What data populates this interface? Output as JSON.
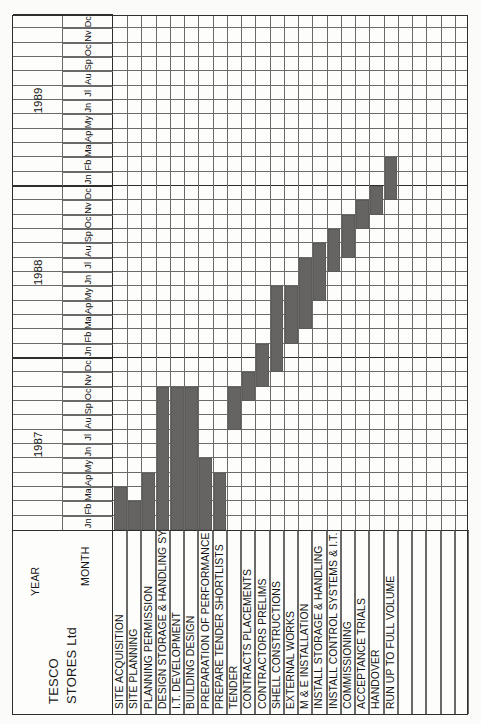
{
  "document": {
    "title_line1": "TESCO",
    "title_line2": "STORES Ltd",
    "year_caption": "YEAR",
    "month_caption": "MONTH"
  },
  "chart_data": {
    "type": "bar",
    "title": "TESCO STORES Ltd",
    "xlabel": "MONTH",
    "ylabel": "",
    "grid": true,
    "orientation": "gantt-vertical-scan",
    "years": [
      "1987",
      "1988",
      "1989"
    ],
    "months": [
      "Jn",
      "Fb",
      "Ma",
      "Ap",
      "My",
      "Jn",
      "Jl",
      "Au",
      "Sp",
      "Oc",
      "Nv",
      "Dc"
    ],
    "month_count_total": 36,
    "categories": [
      "SITE ACQUISITION",
      "SITE PLANNING",
      "PLANNING PERMISSION",
      "DESIGN STORAGE & HANDLING SYSTEMS",
      "I.T. DEVELOPMENT",
      "BUILDING DESIGN",
      "PREPARATION OF PERFORMANCE SPECS",
      "PREPARE TENDER SHORTLISTS",
      "TENDER",
      "CONTRACTS PLACEMENTS",
      "CONTRACTORS PRELIMS",
      "SHELL CONSTRUCTIONS",
      "EXTERNAL WORKS",
      "M & E INSTALLATION",
      "INSTALL STORAGE & HANDLING",
      "INSTALL CONTROL SYSTEMS & I.T.",
      "COMMISSIONING",
      "ACCEPTANCE TRIALS",
      "HANDOVER",
      "RUN UP TO FULL VOLUME",
      "",
      "",
      "",
      "",
      ""
    ],
    "tasks": [
      {
        "name": "SITE ACQUISITION",
        "start_month": 1,
        "end_month": 3,
        "start_label": "Jn 1987",
        "end_label": "Ma 1987",
        "duration_months": 3
      },
      {
        "name": "SITE PLANNING",
        "start_month": 1,
        "end_month": 2,
        "start_label": "Jn 1987",
        "end_label": "Fb 1987",
        "duration_months": 2
      },
      {
        "name": "PLANNING PERMISSION",
        "start_month": 1,
        "end_month": 4,
        "start_label": "Jn 1987",
        "end_label": "Ap 1987",
        "duration_months": 4
      },
      {
        "name": "DESIGN STORAGE & HANDLING SYSTEMS",
        "start_month": 1,
        "end_month": 10,
        "start_label": "Jn 1987",
        "end_label": "Oc 1987",
        "duration_months": 10
      },
      {
        "name": "I.T. DEVELOPMENT",
        "start_month": 1,
        "end_month": 10,
        "start_label": "Jn 1987",
        "end_label": "Oc 1987",
        "duration_months": 10
      },
      {
        "name": "BUILDING DESIGN",
        "start_month": 1,
        "end_month": 10,
        "start_label": "Jn 1987",
        "end_label": "Oc 1987",
        "duration_months": 10
      },
      {
        "name": "PREPARATION OF PERFORMANCE SPECS",
        "start_month": 1,
        "end_month": 5,
        "start_label": "Jn 1987",
        "end_label": "My 1987",
        "duration_months": 5
      },
      {
        "name": "PREPARE TENDER SHORTLISTS",
        "start_month": 1,
        "end_month": 4,
        "start_label": "Jn 1987",
        "end_label": "Ap 1987",
        "duration_months": 4
      },
      {
        "name": "TENDER",
        "start_month": 8,
        "end_month": 10,
        "start_label": "Au 1987",
        "end_label": "Oc 1987",
        "duration_months": 3
      },
      {
        "name": "CONTRACTS PLACEMENTS",
        "start_month": 10,
        "end_month": 11,
        "start_label": "Oc 1987",
        "end_label": "Nv 1987",
        "duration_months": 2
      },
      {
        "name": "CONTRACTORS PRELIMS",
        "start_month": 11,
        "end_month": 13,
        "start_label": "Nv 1987",
        "end_label": "Jn 1988",
        "duration_months": 3
      },
      {
        "name": "SHELL CONSTRUCTIONS",
        "start_month": 12,
        "end_month": 17,
        "start_label": "Dc 1987",
        "end_label": "My 1988",
        "duration_months": 6
      },
      {
        "name": "EXTERNAL WORKS",
        "start_month": 14,
        "end_month": 17,
        "start_label": "Fb 1988",
        "end_label": "My 1988",
        "duration_months": 4
      },
      {
        "name": "M & E INSTALLATION",
        "start_month": 15,
        "end_month": 19,
        "start_label": "Ma 1988",
        "end_label": "Jl 1988",
        "duration_months": 5
      },
      {
        "name": "INSTALL STORAGE & HANDLING",
        "start_month": 17,
        "end_month": 20,
        "start_label": "My 1988",
        "end_label": "Au 1988",
        "duration_months": 4
      },
      {
        "name": "INSTALL CONTROL SYSTEMS & I.T.",
        "start_month": 19,
        "end_month": 21,
        "start_label": "Jl 1988",
        "end_label": "Sp 1988",
        "duration_months": 3
      },
      {
        "name": "COMMISSIONING",
        "start_month": 20,
        "end_month": 22,
        "start_label": "Au 1988",
        "end_label": "Oc 1988",
        "duration_months": 3
      },
      {
        "name": "ACCEPTANCE TRIALS",
        "start_month": 22,
        "end_month": 23,
        "start_label": "Oc 1988",
        "end_label": "Nv 1988",
        "duration_months": 2
      },
      {
        "name": "HANDOVER",
        "start_month": 23,
        "end_month": 24,
        "start_label": "Nv 1988",
        "end_label": "Dc 1988",
        "duration_months": 2
      },
      {
        "name": "RUN UP TO FULL VOLUME",
        "start_month": 24,
        "end_month": 26,
        "start_label": "Dc 1988",
        "end_label": "Fb 1989",
        "duration_months": 3
      }
    ],
    "bar_color": "#666463",
    "grid_color": "#6a6a6a",
    "frame_color": "#2e2e2e"
  }
}
